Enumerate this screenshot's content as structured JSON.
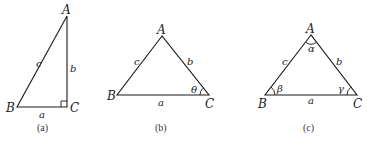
{
  "figures": [
    {
      "id": "a",
      "caption": "(a)",
      "type": "right-triangle",
      "vertices": {
        "A": "A",
        "B": "B",
        "C": "C"
      },
      "sides": {
        "a": "a",
        "b": "b",
        "c": "c"
      },
      "right_angle_at": "C"
    },
    {
      "id": "b",
      "caption": "(b)",
      "type": "triangle",
      "vertices": {
        "A": "A",
        "B": "B",
        "C": "C"
      },
      "sides": {
        "a": "a",
        "b": "b",
        "c": "c"
      },
      "angles": {
        "C": "θ"
      }
    },
    {
      "id": "c",
      "caption": "(c)",
      "type": "triangle",
      "vertices": {
        "A": "A",
        "B": "B",
        "C": "C"
      },
      "sides": {
        "a": "a",
        "b": "b",
        "c": "c"
      },
      "angles": {
        "A": "α",
        "B": "β",
        "C": "γ"
      }
    }
  ],
  "colors": {
    "stroke": "#1a1a1a",
    "text": "#222222",
    "background": "#ffffff"
  }
}
